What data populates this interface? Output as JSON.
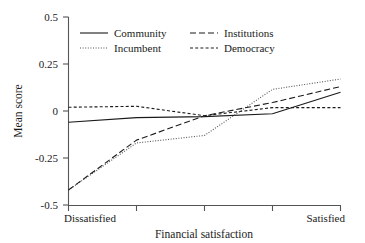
{
  "chart_data": {
    "type": "line",
    "title": "",
    "xlabel": "Financial satisfaction",
    "ylabel": "Mean score",
    "x": [
      1,
      2,
      3,
      4,
      5
    ],
    "categories": [
      "Dissatisfied",
      "",
      "",
      "",
      "Satisfied"
    ],
    "xtick_labels": [
      "Dissatisfied",
      "Satisfied"
    ],
    "ytick_labels": [
      "0.5",
      "0.25",
      "0",
      "-0.25",
      "-0.5"
    ],
    "ytick_values": [
      0.5,
      0.25,
      0,
      -0.25,
      -0.5
    ],
    "ylim": [
      -0.5,
      0.5
    ],
    "xlim": [
      1,
      5
    ],
    "grid": false,
    "legend_position": "top-left-inside",
    "series": [
      {
        "name": "Community",
        "style": "solid",
        "color": "#1a1a1a",
        "values": [
          -0.06,
          -0.035,
          -0.03,
          -0.015,
          0.1
        ]
      },
      {
        "name": "Incumbent",
        "style": "dotted",
        "color": "#555555",
        "values": [
          -0.42,
          -0.17,
          -0.13,
          0.115,
          0.17
        ]
      },
      {
        "name": "Institutions",
        "style": "dashed-long",
        "color": "#1a1a1a",
        "values": [
          -0.42,
          -0.155,
          -0.025,
          0.045,
          0.13
        ]
      },
      {
        "name": "Democracy",
        "style": "dashed-short",
        "color": "#1a1a1a",
        "values": [
          0.02,
          0.025,
          -0.025,
          0.018,
          0.018
        ]
      }
    ]
  },
  "axes": {
    "y_label": "Mean score",
    "x_label": "Financial satisfaction",
    "y_ticks": [
      "0.5",
      "0.25",
      "0",
      "-0.25",
      "-0.5"
    ],
    "x_left_label": "Dissatisfied",
    "x_right_label": "Satisfied"
  },
  "legend": {
    "entries": [
      {
        "label": "Community",
        "style": "solid"
      },
      {
        "label": "Institutions",
        "style": "dashed-long"
      },
      {
        "label": "Incumbent",
        "style": "dotted"
      },
      {
        "label": "Democracy",
        "style": "dashed-short"
      }
    ]
  },
  "colors": {
    "line": "#1a1a1a",
    "dotted_line": "#555555",
    "axis": "#555555",
    "background": "#ffffff"
  }
}
